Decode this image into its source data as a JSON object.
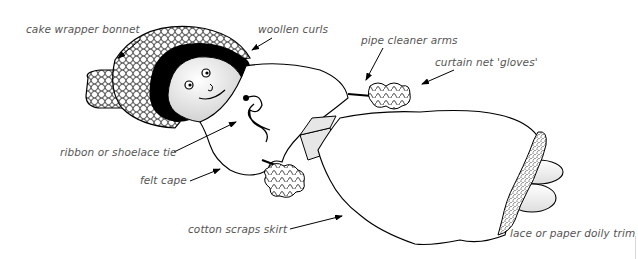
{
  "diagram": {
    "labels": [
      {
        "id": "bonnet",
        "text": "cake wrapper bonnet",
        "x": 26,
        "y": 23
      },
      {
        "id": "curls",
        "text": "woollen curls",
        "x": 258,
        "y": 23
      },
      {
        "id": "arms",
        "text": "pipe cleaner arms",
        "x": 361,
        "y": 34
      },
      {
        "id": "gloves",
        "text": "curtain net 'gloves'",
        "x": 435,
        "y": 56
      },
      {
        "id": "tie",
        "text": "ribbon or shoelace tie",
        "x": 60,
        "y": 146
      },
      {
        "id": "cape",
        "text": "felt cape",
        "x": 140,
        "y": 174
      },
      {
        "id": "skirt",
        "text": "cotton scraps skirt",
        "x": 188,
        "y": 223
      },
      {
        "id": "trim",
        "text": "lace or paper doily trim",
        "x": 510,
        "y": 227
      }
    ],
    "colors": {
      "line": "#000000",
      "label_text": "#555555",
      "fill_white": "#ffffff",
      "fill_shade": "#e6e6e6"
    }
  }
}
